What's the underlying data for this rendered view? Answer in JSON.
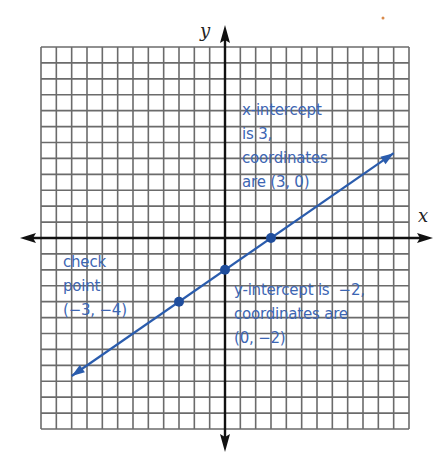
{
  "chart_data": {
    "type": "line",
    "title": "",
    "xlabel": "x",
    "ylabel": "y",
    "xlim": [
      -12,
      12
    ],
    "ylim": [
      -12,
      12
    ],
    "grid": true,
    "grid_step": 1,
    "equation": "y = (2/3)x - 2",
    "series": [
      {
        "name": "line",
        "x": [
          -10,
          11
        ],
        "y": [
          -8.67,
          5.33
        ],
        "color": "#2a5cad",
        "arrows": "both"
      }
    ],
    "points": [
      {
        "name": "x-intercept",
        "x": 3,
        "y": 0
      },
      {
        "name": "y-intercept",
        "x": 0,
        "y": -2
      },
      {
        "name": "check point",
        "x": -3,
        "y": -4
      }
    ],
    "annotations": [
      {
        "id": "x_intercept",
        "lines": [
          "x-intercept",
          "is 3,",
          "coordinates",
          "are (3, 0)"
        ]
      },
      {
        "id": "check_point",
        "lines": [
          "check",
          "point",
          "(−3, −4)"
        ]
      },
      {
        "id": "y_intercept",
        "lines": [
          "y-intercept is  −2,",
          "coordinates are",
          "(0, −2)"
        ]
      }
    ]
  },
  "labels": {
    "x_axis": "x",
    "y_axis": "y",
    "x_intercept": "x-intercept\nis 3,\ncoordinates\nare (3, 0)",
    "check_point": "check\npoint\n(−3, −4)",
    "y_intercept": "y-intercept is  −2,\ncoordinates are\n(0, −2)"
  },
  "colors": {
    "grid": "#6b6b6b",
    "axis": "#111111",
    "line": "#2a5cad",
    "point": "#1f4d9c",
    "text": "#3d66b3"
  }
}
